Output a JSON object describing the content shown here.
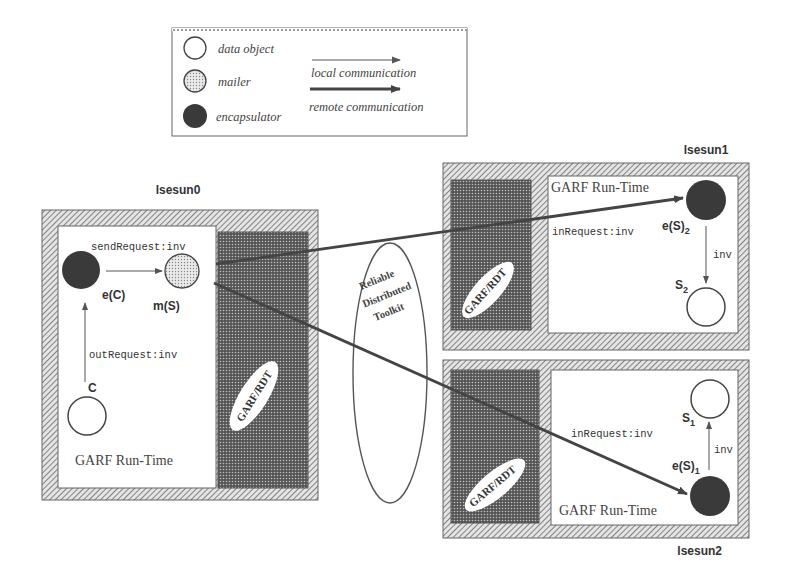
{
  "legend": {
    "items": [
      {
        "symbol": "data-object-circle",
        "label": "data object"
      },
      {
        "symbol": "mailer-circle",
        "label": "mailer"
      },
      {
        "symbol": "encapsulator-circle",
        "label": "encapsulator"
      }
    ],
    "arrows": [
      {
        "type": "thin-arrow",
        "label": "local communication"
      },
      {
        "type": "thick-arrow",
        "label": "remote communication"
      }
    ]
  },
  "hosts": {
    "h0": {
      "name": "lsesun0",
      "runtime_label": "GARF Run-Time",
      "rdt_label": "GARF/RDT",
      "client_label": "C",
      "encapsulator_label": "e(C)",
      "mailer_label": "m(S)",
      "send_label": "sendRequest:inv",
      "out_label": "outRequest:inv"
    },
    "h1": {
      "name": "lsesun1",
      "runtime_label": "GARF Run-Time",
      "rdt_label": "GARF/RDT",
      "in_label": "inRequest:inv",
      "encapsulator_label": "e(S)",
      "encapsulator_sub": "2",
      "server_label": "S",
      "server_sub": "2",
      "inv_label": "inv"
    },
    "h2": {
      "name": "lsesun2",
      "runtime_label": "GARF Run-Time",
      "rdt_label": "GARF/RDT",
      "in_label": "inRequest:inv",
      "encapsulator_label": "e(S)",
      "encapsulator_sub": "1",
      "server_label": "S",
      "server_sub": "1",
      "inv_label": "inv"
    }
  },
  "toolkit": {
    "line1": "Reliable",
    "line2": "Distributed",
    "line3": "Toolkit"
  },
  "colors": {
    "ink": "#333333",
    "encapsulator": "#3a3a3a",
    "mailer": "#cfcfcf",
    "rdt_fill": "#6e6e6e",
    "frame": "#9a9a9a"
  }
}
